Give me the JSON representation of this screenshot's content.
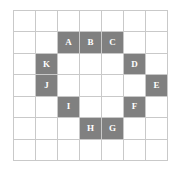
{
  "figure": {
    "grid": {
      "columns": 7,
      "rows": 7,
      "line_color": "#c9c9c9",
      "cell_background": "#ffffff",
      "filled_color": "#808080",
      "label_color": "#ffffff"
    },
    "cells": [
      {
        "row": 1,
        "col": 1,
        "filled": false,
        "label": ""
      },
      {
        "row": 1,
        "col": 2,
        "filled": false,
        "label": ""
      },
      {
        "row": 1,
        "col": 3,
        "filled": false,
        "label": ""
      },
      {
        "row": 1,
        "col": 4,
        "filled": false,
        "label": ""
      },
      {
        "row": 1,
        "col": 5,
        "filled": false,
        "label": ""
      },
      {
        "row": 1,
        "col": 6,
        "filled": false,
        "label": ""
      },
      {
        "row": 1,
        "col": 7,
        "filled": false,
        "label": ""
      },
      {
        "row": 2,
        "col": 1,
        "filled": false,
        "label": ""
      },
      {
        "row": 2,
        "col": 2,
        "filled": false,
        "label": ""
      },
      {
        "row": 2,
        "col": 3,
        "filled": true,
        "label": "A"
      },
      {
        "row": 2,
        "col": 4,
        "filled": true,
        "label": "B"
      },
      {
        "row": 2,
        "col": 5,
        "filled": true,
        "label": "C"
      },
      {
        "row": 2,
        "col": 6,
        "filled": false,
        "label": ""
      },
      {
        "row": 2,
        "col": 7,
        "filled": false,
        "label": ""
      },
      {
        "row": 3,
        "col": 1,
        "filled": false,
        "label": ""
      },
      {
        "row": 3,
        "col": 2,
        "filled": true,
        "label": "K"
      },
      {
        "row": 3,
        "col": 3,
        "filled": false,
        "label": ""
      },
      {
        "row": 3,
        "col": 4,
        "filled": false,
        "label": ""
      },
      {
        "row": 3,
        "col": 5,
        "filled": false,
        "label": ""
      },
      {
        "row": 3,
        "col": 6,
        "filled": true,
        "label": "D"
      },
      {
        "row": 3,
        "col": 7,
        "filled": false,
        "label": ""
      },
      {
        "row": 4,
        "col": 1,
        "filled": false,
        "label": ""
      },
      {
        "row": 4,
        "col": 2,
        "filled": true,
        "label": "J"
      },
      {
        "row": 4,
        "col": 3,
        "filled": false,
        "label": ""
      },
      {
        "row": 4,
        "col": 4,
        "filled": false,
        "label": ""
      },
      {
        "row": 4,
        "col": 5,
        "filled": false,
        "label": ""
      },
      {
        "row": 4,
        "col": 6,
        "filled": false,
        "label": ""
      },
      {
        "row": 4,
        "col": 7,
        "filled": true,
        "label": "E"
      },
      {
        "row": 5,
        "col": 1,
        "filled": false,
        "label": ""
      },
      {
        "row": 5,
        "col": 2,
        "filled": false,
        "label": ""
      },
      {
        "row": 5,
        "col": 3,
        "filled": true,
        "label": "I"
      },
      {
        "row": 5,
        "col": 4,
        "filled": false,
        "label": ""
      },
      {
        "row": 5,
        "col": 5,
        "filled": false,
        "label": ""
      },
      {
        "row": 5,
        "col": 6,
        "filled": true,
        "label": "F"
      },
      {
        "row": 5,
        "col": 7,
        "filled": false,
        "label": ""
      },
      {
        "row": 6,
        "col": 1,
        "filled": false,
        "label": ""
      },
      {
        "row": 6,
        "col": 2,
        "filled": false,
        "label": ""
      },
      {
        "row": 6,
        "col": 3,
        "filled": false,
        "label": ""
      },
      {
        "row": 6,
        "col": 4,
        "filled": true,
        "label": "H"
      },
      {
        "row": 6,
        "col": 5,
        "filled": true,
        "label": "G"
      },
      {
        "row": 6,
        "col": 6,
        "filled": false,
        "label": ""
      },
      {
        "row": 6,
        "col": 7,
        "filled": false,
        "label": ""
      },
      {
        "row": 7,
        "col": 1,
        "filled": false,
        "label": ""
      },
      {
        "row": 7,
        "col": 2,
        "filled": false,
        "label": ""
      },
      {
        "row": 7,
        "col": 3,
        "filled": false,
        "label": ""
      },
      {
        "row": 7,
        "col": 4,
        "filled": false,
        "label": ""
      },
      {
        "row": 7,
        "col": 5,
        "filled": false,
        "label": ""
      },
      {
        "row": 7,
        "col": 6,
        "filled": false,
        "label": ""
      },
      {
        "row": 7,
        "col": 7,
        "filled": false,
        "label": ""
      }
    ],
    "labels_in_order": [
      "A",
      "B",
      "C",
      "D",
      "E",
      "F",
      "G",
      "H",
      "I",
      "J",
      "K"
    ]
  }
}
